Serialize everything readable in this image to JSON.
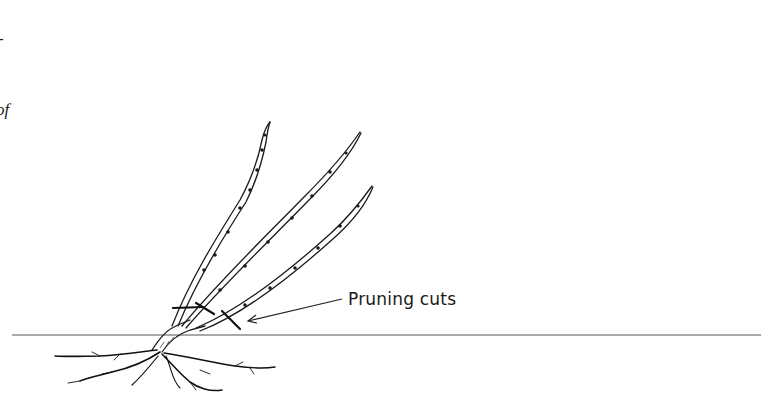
{
  "figure": {
    "left_margin_fragments": [
      "-",
      "of",
      "l"
    ],
    "callout_label": "Pruning cuts",
    "plants": [
      {
        "id": "left",
        "description": "leaning bramble with three canes and pruning cuts near base",
        "cut_count": 3
      },
      {
        "id": "right",
        "description": "upright bramble with three canes and pruning cuts near base",
        "cut_count": 3
      }
    ],
    "colors": {
      "ink": "#1a1a1a",
      "background": "#ffffff",
      "ground_line": "#555555"
    }
  }
}
